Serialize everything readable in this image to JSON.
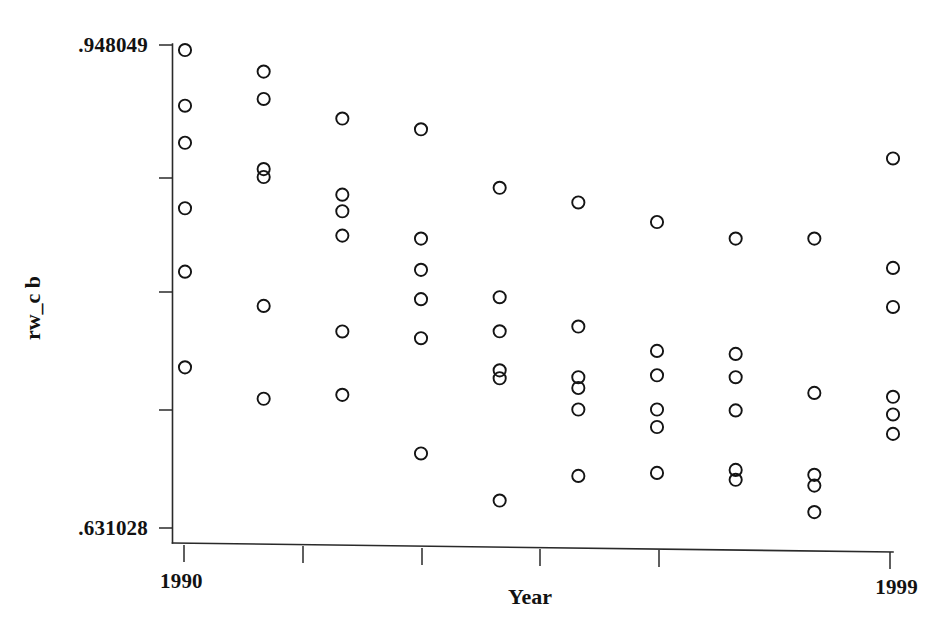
{
  "figure": {
    "kind": "scatter-plot",
    "background_color": "#ffffff",
    "marker_color": "#141414",
    "axis_color": "#2a2a2a",
    "marker_shape": "open-circle"
  },
  "axes": {
    "y_title": "rw_c b",
    "x_title": "Year",
    "y_tick_labels": [
      ".948049",
      ".631028"
    ],
    "y_top_label": ".948049",
    "y_bottom_label": ".631028",
    "x_tick_labels": [
      "1990",
      "1999"
    ],
    "x_first_label": "1990",
    "x_last_label": "1999",
    "y_minor_tick_count": 5,
    "x_minor_tick_count": 6,
    "grid": "off",
    "legend": "none"
  },
  "chart_data": {
    "type": "scatter",
    "title": "",
    "subtitle": "",
    "xlabel": "Year",
    "ylabel": "rw_c b",
    "xlim": [
      1990,
      1999
    ],
    "ylim": [
      0.631028,
      0.948049
    ],
    "xticks": [
      1990,
      1999
    ],
    "yticks": [
      0.631028,
      0.948049
    ],
    "grid": false,
    "legend_position": "none",
    "annotations": [],
    "series": [
      {
        "name": "rw_c b",
        "marker": "open-circle",
        "points": [
          {
            "x": 1990,
            "y": 0.948
          },
          {
            "x": 1990,
            "y": 0.9108
          },
          {
            "x": 1990,
            "y": 0.886
          },
          {
            "x": 1990,
            "y": 0.8422
          },
          {
            "x": 1990,
            "y": 0.7998
          },
          {
            "x": 1990,
            "y": 0.7358
          },
          {
            "x": 1991,
            "y": 0.9336
          },
          {
            "x": 1991,
            "y": 0.9153
          },
          {
            "x": 1991,
            "y": 0.8684
          },
          {
            "x": 1991,
            "y": 0.8631
          },
          {
            "x": 1991,
            "y": 0.7769
          },
          {
            "x": 1991,
            "y": 0.7148
          },
          {
            "x": 1992,
            "y": 0.9022
          },
          {
            "x": 1992,
            "y": 0.8513
          },
          {
            "x": 1992,
            "y": 0.8402
          },
          {
            "x": 1992,
            "y": 0.8239
          },
          {
            "x": 1992,
            "y": 0.7598
          },
          {
            "x": 1992,
            "y": 0.7174
          },
          {
            "x": 1993,
            "y": 0.895
          },
          {
            "x": 1993,
            "y": 0.8219
          },
          {
            "x": 1993,
            "y": 0.801
          },
          {
            "x": 1993,
            "y": 0.7814
          },
          {
            "x": 1993,
            "y": 0.7553
          },
          {
            "x": 1993,
            "y": 0.6782
          },
          {
            "x": 1994,
            "y": 0.8559
          },
          {
            "x": 1994,
            "y": 0.7827
          },
          {
            "x": 1994,
            "y": 0.7599
          },
          {
            "x": 1994,
            "y": 0.7338
          },
          {
            "x": 1994,
            "y": 0.7285
          },
          {
            "x": 1994,
            "y": 0.6467
          },
          {
            "x": 1995,
            "y": 0.8461
          },
          {
            "x": 1995,
            "y": 0.7631
          },
          {
            "x": 1995,
            "y": 0.7292
          },
          {
            "x": 1995,
            "y": 0.722
          },
          {
            "x": 1995,
            "y": 0.7076
          },
          {
            "x": 1995,
            "y": 0.6632
          },
          {
            "x": 1996,
            "y": 0.833
          },
          {
            "x": 1996,
            "y": 0.7468
          },
          {
            "x": 1996,
            "y": 0.7305
          },
          {
            "x": 1996,
            "y": 0.7076
          },
          {
            "x": 1996,
            "y": 0.6959
          },
          {
            "x": 1996,
            "y": 0.6652
          },
          {
            "x": 1997,
            "y": 0.8219
          },
          {
            "x": 1997,
            "y": 0.7448
          },
          {
            "x": 1997,
            "y": 0.7292
          },
          {
            "x": 1997,
            "y": 0.707
          },
          {
            "x": 1997,
            "y": 0.6672
          },
          {
            "x": 1997,
            "y": 0.6606
          },
          {
            "x": 1998,
            "y": 0.8219
          },
          {
            "x": 1998,
            "y": 0.7187
          },
          {
            "x": 1998,
            "y": 0.6639
          },
          {
            "x": 1998,
            "y": 0.6567
          },
          {
            "x": 1998,
            "y": 0.639
          },
          {
            "x": 1999,
            "y": 0.8755
          },
          {
            "x": 1999,
            "y": 0.8023
          },
          {
            "x": 1999,
            "y": 0.7762
          },
          {
            "x": 1999,
            "y": 0.7161
          },
          {
            "x": 1999,
            "y": 0.7043
          },
          {
            "x": 1999,
            "y": 0.6913
          }
        ]
      }
    ]
  }
}
